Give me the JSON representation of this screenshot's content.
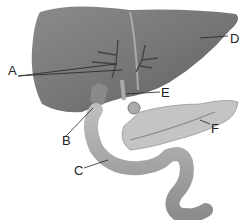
{
  "diagram": {
    "labels": [
      {
        "id": "A",
        "text": "A",
        "x": 8,
        "y": 70
      },
      {
        "id": "B",
        "text": "B",
        "x": 64,
        "y": 141
      },
      {
        "id": "C",
        "text": "C",
        "x": 77,
        "y": 171
      },
      {
        "id": "D",
        "text": "D",
        "x": 231,
        "y": 32
      },
      {
        "id": "E",
        "text": "E",
        "x": 163,
        "y": 88
      },
      {
        "id": "F",
        "text": "F",
        "x": 212,
        "y": 122
      }
    ],
    "colors": {
      "organ_dark": "#6e6e6e",
      "organ_mid": "#9a9a9a",
      "organ_light": "#c8c8c8",
      "line": "#222222"
    }
  }
}
